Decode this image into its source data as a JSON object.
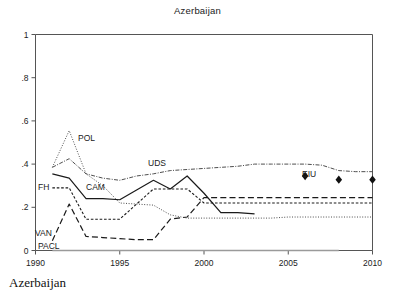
{
  "chart_data": {
    "type": "line",
    "title": "Azerbaijan",
    "caption": "Azerbaijan",
    "xlabel": "",
    "ylabel": "",
    "xlim": [
      1990,
      2010
    ],
    "ylim": [
      0,
      1
    ],
    "grid": false,
    "legend_position": "inline-annotations",
    "x_ticks": [
      "1990",
      "1995",
      "2000",
      "2005",
      "2010"
    ],
    "x_tick_values": [
      1990,
      1995,
      2000,
      2005,
      2010
    ],
    "y_ticks": [
      "0",
      ".2",
      ".4",
      ".6",
      ".8",
      "1"
    ],
    "y_tick_values": [
      0,
      0.2,
      0.4,
      0.6,
      0.8,
      1
    ],
    "series": [
      {
        "name": "POL",
        "label": "POL",
        "style": "dotted-fine",
        "color": "#3a3a3a",
        "x": [
          1991,
          1992,
          1993,
          1994,
          1995,
          1996,
          1997,
          1998,
          1999,
          2000,
          2001,
          2002,
          2003,
          2004,
          2005,
          2006,
          2007,
          2008,
          2009,
          2010
        ],
        "values": [
          0.385,
          0.555,
          0.355,
          0.3,
          0.22,
          0.215,
          0.21,
          0.165,
          0.15,
          0.15,
          0.15,
          0.15,
          0.15,
          0.15,
          0.155,
          0.155,
          0.155,
          0.155,
          0.155,
          0.155
        ]
      },
      {
        "name": "UDS",
        "label": "UDS",
        "style": "dash-dot",
        "color": "#3a3a3a",
        "x": [
          1991,
          1992,
          1993,
          1994,
          1995,
          1996,
          1997,
          1998,
          1999,
          2000,
          2001,
          2002,
          2003,
          2004,
          2005,
          2006,
          2007,
          2008,
          2009,
          2010
        ],
        "values": [
          0.385,
          0.425,
          0.355,
          0.335,
          0.325,
          0.345,
          0.355,
          0.37,
          0.375,
          0.38,
          0.385,
          0.39,
          0.4,
          0.4,
          0.4,
          0.4,
          0.395,
          0.37,
          0.365,
          0.365
        ]
      },
      {
        "name": "CAM",
        "label": "CAM",
        "style": "solid",
        "color": "#1a1a1a",
        "x": [
          1991,
          1992,
          1993,
          1994,
          1995,
          1996,
          1997,
          1998,
          1999,
          2000,
          2001,
          2002,
          2003
        ],
        "values": [
          0.355,
          0.335,
          0.24,
          0.24,
          0.235,
          0.28,
          0.325,
          0.285,
          0.345,
          0.265,
          0.175,
          0.175,
          0.17
        ]
      },
      {
        "name": "FH",
        "label": "FH",
        "style": "dashed-short",
        "color": "#1a1a1a",
        "x": [
          1991,
          1992,
          1993,
          1994,
          1995,
          1996,
          1997,
          1998,
          1999,
          2000,
          2001,
          2002,
          2003,
          2004,
          2005,
          2006,
          2007,
          2008,
          2009,
          2010
        ],
        "values": [
          0.29,
          0.29,
          0.145,
          0.145,
          0.145,
          0.215,
          0.285,
          0.285,
          0.285,
          0.22,
          0.22,
          0.22,
          0.22,
          0.22,
          0.22,
          0.22,
          0.22,
          0.22,
          0.22,
          0.22
        ]
      },
      {
        "name": "VAN",
        "label": "VAN",
        "style": "dashed-long",
        "color": "#1a1a1a",
        "x": [
          1991,
          1992,
          1993,
          1994,
          1995,
          1996,
          1997,
          1998,
          1999,
          2000,
          2001,
          2002,
          2003,
          2004,
          2005,
          2006,
          2007,
          2008,
          2009,
          2010
        ],
        "values": [
          0.045,
          0.215,
          0.065,
          0.06,
          0.055,
          0.05,
          0.05,
          0.145,
          0.155,
          0.245,
          0.245,
          0.245,
          0.245,
          0.245,
          0.245,
          0.245,
          0.245,
          0.245,
          0.245,
          0.245
        ]
      },
      {
        "name": "PACL",
        "label": "PACL",
        "style": "solid-gray",
        "color": "#9a9a9a",
        "x": [
          1991,
          2008
        ],
        "values": [
          0.0,
          0.0
        ]
      }
    ],
    "markers": [
      {
        "name": "EIU",
        "label": "EIU",
        "shape": "diamond",
        "x": 2006,
        "y": 0.345,
        "color": "#111111"
      },
      {
        "name": "EIU",
        "label": "",
        "shape": "diamond",
        "x": 2008,
        "y": 0.328,
        "color": "#111111"
      },
      {
        "name": "EIU",
        "label": "",
        "shape": "diamond",
        "x": 2010,
        "y": 0.328,
        "color": "#111111"
      }
    ],
    "annotations": [
      {
        "name": "POL",
        "text": "POL",
        "x": 2.5,
        "y": 141
      },
      {
        "name": "UDS",
        "text": "UDS",
        "x": 148,
        "y": 166
      },
      {
        "name": "CAM",
        "text": "CAM",
        "x": 86,
        "y": 190
      },
      {
        "name": "FH",
        "text": "FH",
        "x": 38,
        "y": 190
      },
      {
        "name": "VAN",
        "text": "VAN",
        "x": 35,
        "y": 236
      },
      {
        "name": "PACL",
        "text": "PACL",
        "x": 38,
        "y": 249
      },
      {
        "name": "EIU",
        "text": "EIU",
        "x": 302,
        "y": 177
      }
    ]
  }
}
